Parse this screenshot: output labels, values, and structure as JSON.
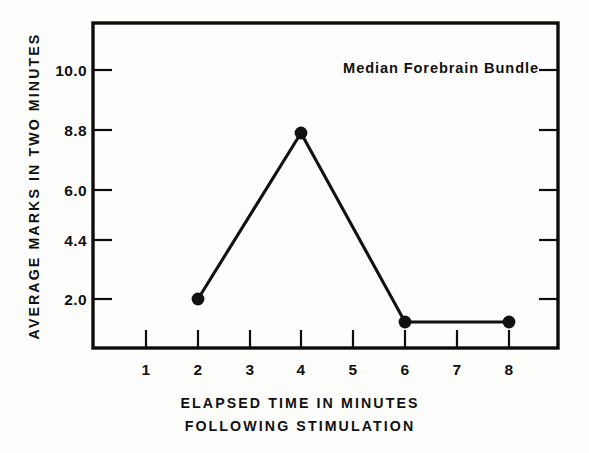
{
  "chart_data": {
    "type": "line",
    "title": "",
    "annotation": "Median Forebrain Bundle",
    "xlabel_line1": "ELAPSED TIME IN MINUTES",
    "xlabel_line2": "FOLLOWING STIMULATION",
    "ylabel": "AVERAGE MARKS IN TWO MINUTES",
    "x": [
      2,
      4,
      6,
      8
    ],
    "values": [
      2.0,
      8.8,
      1.0,
      1.0
    ],
    "point_labels": [
      "2.0",
      "8.8",
      "",
      ""
    ],
    "xticks": [
      1,
      2,
      3,
      4,
      5,
      6,
      7,
      8
    ],
    "xtick_labels": [
      "1",
      "2",
      "3",
      "4",
      "5",
      "6",
      "7",
      "8"
    ],
    "yticks": [
      2.0,
      4.4,
      6.0,
      8.8,
      10.0
    ],
    "ytick_labels": [
      "2.0",
      "4.4",
      "6.0",
      "8.8",
      "10.0"
    ],
    "xlim": [
      0.5,
      8.5
    ],
    "ylim_note": "ticks evenly spaced though values unevenly valued",
    "grid": "off",
    "legend_position": "none",
    "series_name": "Median Forebrain Bundle",
    "line_color": "#111111",
    "marker_color": "#111111",
    "marker": "filled-circle",
    "background_color": "#fdfdfc",
    "axis_color": "#0d0d0d"
  },
  "ytick_positions_px": [
    299,
    240,
    190,
    130,
    70
  ],
  "xtick_positions_px": [
    146,
    198,
    250,
    301,
    353,
    405,
    457,
    509
  ],
  "point_positions_px": [
    {
      "x": 198,
      "y": 299
    },
    {
      "x": 301,
      "y": 133
    },
    {
      "x": 405,
      "y": 322
    },
    {
      "x": 509,
      "y": 322
    }
  ]
}
